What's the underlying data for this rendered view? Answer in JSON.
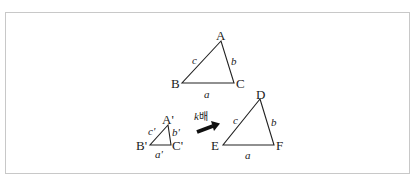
{
  "diagram": {
    "triangle_abc": {
      "vertices": {
        "A": "A",
        "B": "B",
        "C": "C"
      },
      "sides": {
        "a": "a",
        "b": "b",
        "c": "c"
      }
    },
    "triangle_small": {
      "vertices": {
        "A": "A'",
        "B": "B'",
        "C": "C'"
      },
      "sides": {
        "a": "a'",
        "b": "b'",
        "c": "c'"
      }
    },
    "arrow_label_k": "k",
    "arrow_label_suffix": "배",
    "triangle_def": {
      "vertices": {
        "D": "D",
        "E": "E",
        "F": "F"
      },
      "sides": {
        "a": "a",
        "b": "b",
        "c": "c"
      }
    },
    "colors": {
      "stroke": "#222222",
      "frame": "#c8c8c8"
    }
  }
}
